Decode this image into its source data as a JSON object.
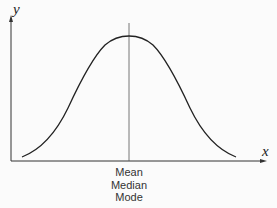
{
  "diagram": {
    "title": "",
    "axes": {
      "x_label": "x",
      "y_label": "y"
    },
    "curve": {
      "type": "normal distribution (bell curve)",
      "symmetric": true
    },
    "center_line": {
      "labels": [
        "Mean",
        "Median",
        "Mode"
      ]
    },
    "colors": {
      "background": "#fbfbfb",
      "axis": "#333333",
      "curve": "#222222",
      "center_line": "#555555",
      "text": "#333333"
    }
  }
}
